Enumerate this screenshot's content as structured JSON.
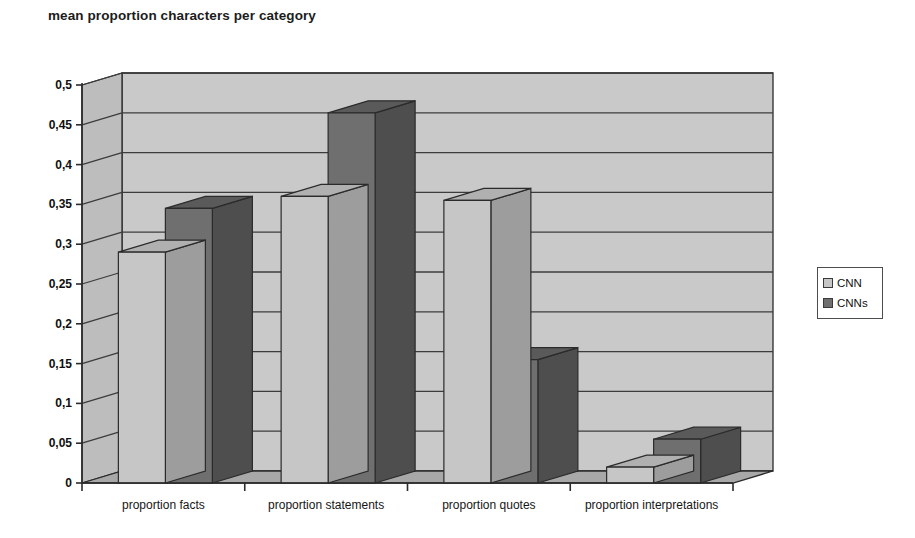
{
  "chart_data": {
    "type": "bar",
    "title": "mean proportion characters per category",
    "xlabel": "",
    "ylabel": "",
    "categories": [
      "proportion facts",
      "proportion statements",
      "proportion quotes",
      "proportion interpretations"
    ],
    "series": [
      {
        "name": "CNN",
        "values": [
          0.29,
          0.36,
          0.355,
          0.02
        ]
      },
      {
        "name": "CNNs",
        "values": [
          0.345,
          0.465,
          0.155,
          0.055
        ]
      }
    ],
    "ylim": [
      0,
      0.5
    ],
    "ytick_labels": [
      "0",
      "0,05",
      "0,1",
      "0,15",
      "0,2",
      "0,25",
      "0,3",
      "0,35",
      "0,4",
      "0,45",
      "0,5"
    ],
    "ytick_values": [
      0,
      0.05,
      0.1,
      0.15,
      0.2,
      0.25,
      0.3,
      0.35,
      0.4,
      0.45,
      0.5
    ],
    "grid": true,
    "three_d": true,
    "legend_position": "right",
    "legend_entries": [
      "CNN",
      "CNNs"
    ],
    "colors": {
      "series_cnn_front": "#c6c6c6",
      "series_cnn_top": "#b0b0b0",
      "series_cnn_side": "#9d9d9d",
      "series_cnns_front": "#6f6f6f",
      "series_cnns_top": "#5a5a5a",
      "series_cnns_side": "#4e4e4e",
      "back_wall": "#c9c9c9",
      "left_wall": "#bdbdbd",
      "floor": "#a8a8a8",
      "axis_line": "#2b2b2b",
      "grid_line": "#3c3c3c"
    }
  }
}
